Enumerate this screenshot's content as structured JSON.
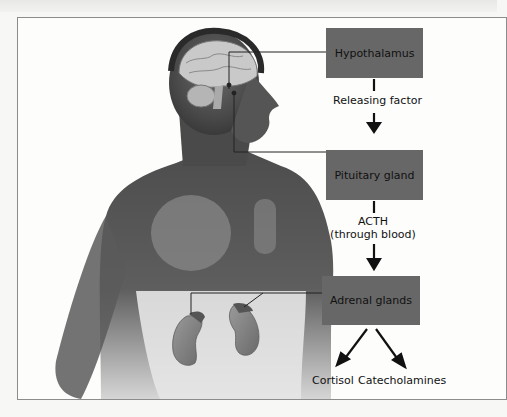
{
  "figure": {
    "type": "hormone-pathway-diagram",
    "illustration": "human-torso-with-brain-and-kidneys",
    "nodes": [
      {
        "id": "hypothalamus",
        "label": "Hypothalamus"
      },
      {
        "id": "pituitary",
        "label": "Pituitary gland"
      },
      {
        "id": "adrenal",
        "label": "Adrenal glands"
      }
    ],
    "edges": [
      {
        "from": "hypothalamus",
        "to": "pituitary",
        "label": "Releasing factor"
      },
      {
        "from": "pituitary",
        "to": "adrenal",
        "label_line1": "ACTH",
        "label_line2": "(through blood)"
      },
      {
        "from": "adrenal",
        "to": "cortisol",
        "label": ""
      },
      {
        "from": "adrenal",
        "to": "catecholamines",
        "label": ""
      }
    ],
    "outputs": [
      {
        "id": "cortisol",
        "label": "Cortisol"
      },
      {
        "id": "catecholamines",
        "label": "Catecholamines"
      }
    ],
    "colors": {
      "box_fill": "#676767",
      "box_text": "#111111",
      "arrow": "#111111",
      "frame_border": "#8c8c8c",
      "background": "#fdfdfc"
    }
  }
}
